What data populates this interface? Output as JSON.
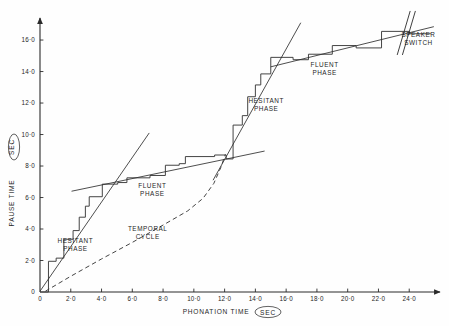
{
  "figure": {
    "background_color": "#fefefe",
    "ink_color": "#2a2a2a"
  },
  "chart_data": {
    "type": "line",
    "title": "",
    "subtitle": "",
    "xlabel_parts": {
      "main": "PHONATION  TIME",
      "unit": "SEC"
    },
    "ylabel_parts": {
      "main": "PAUSE  TIME",
      "unit": "SEC"
    },
    "xlabel": "PHONATION TIME (SEC)",
    "ylabel": "PAUSE TIME (SEC)",
    "xlim": [
      0,
      26
    ],
    "ylim": [
      0,
      17.4
    ],
    "grid": false,
    "legend_position": "none",
    "x_tick_values": [
      0,
      2,
      4,
      6,
      8,
      10,
      12,
      14,
      16,
      18,
      20,
      22,
      24
    ],
    "x_tick_labels": [
      "0",
      "2·0",
      "4·0",
      "6·0",
      "8·0",
      "10·0",
      "12·0",
      "14·0",
      "16·0",
      "18·0",
      "20·0",
      "22·0",
      "24·0"
    ],
    "y_tick_values": [
      0,
      2,
      4,
      6,
      8,
      10,
      12,
      14,
      16
    ],
    "y_tick_labels": [
      "0",
      "2·0",
      "4·0",
      "6·0",
      "8·0",
      "10·0",
      "12·0",
      "14·0",
      "16·0"
    ],
    "series": [
      {
        "name": "cumulative-staircase",
        "style": "step",
        "description": "Cumulative pause time plotted against cumulative phonation time as a staircase of alternating speech runs and pauses",
        "points": [
          [
            0.0,
            0.0
          ],
          [
            0.55,
            0.0
          ],
          [
            0.55,
            1.95
          ],
          [
            1.05,
            1.95
          ],
          [
            1.05,
            2.15
          ],
          [
            1.55,
            2.15
          ],
          [
            1.55,
            3.35
          ],
          [
            2.15,
            3.35
          ],
          [
            2.15,
            3.9
          ],
          [
            2.55,
            3.9
          ],
          [
            2.55,
            4.75
          ],
          [
            2.95,
            4.75
          ],
          [
            2.95,
            5.45
          ],
          [
            3.2,
            5.45
          ],
          [
            3.2,
            6.05
          ],
          [
            4.05,
            6.05
          ],
          [
            4.05,
            6.85
          ],
          [
            5.05,
            6.85
          ],
          [
            5.05,
            6.95
          ],
          [
            5.65,
            6.95
          ],
          [
            5.65,
            7.25
          ],
          [
            7.15,
            7.25
          ],
          [
            7.15,
            7.4
          ],
          [
            8.15,
            7.4
          ],
          [
            8.15,
            8.05
          ],
          [
            9.05,
            8.05
          ],
          [
            9.05,
            8.15
          ],
          [
            9.45,
            8.15
          ],
          [
            9.45,
            8.6
          ],
          [
            11.35,
            8.6
          ],
          [
            11.35,
            8.7
          ],
          [
            12.1,
            8.7
          ],
          [
            12.1,
            8.45
          ],
          [
            12.55,
            8.45
          ],
          [
            12.55,
            10.6
          ],
          [
            13.15,
            10.6
          ],
          [
            13.15,
            11.2
          ],
          [
            13.5,
            11.2
          ],
          [
            13.5,
            12.4
          ],
          [
            14.0,
            12.4
          ],
          [
            14.0,
            13.15
          ],
          [
            14.35,
            13.15
          ],
          [
            14.35,
            13.85
          ],
          [
            15.0,
            13.85
          ],
          [
            15.0,
            14.9
          ],
          [
            16.45,
            14.9
          ],
          [
            16.45,
            14.75
          ],
          [
            17.45,
            14.75
          ],
          [
            17.45,
            15.1
          ],
          [
            19.0,
            15.1
          ],
          [
            19.0,
            15.65
          ],
          [
            20.55,
            15.65
          ],
          [
            20.55,
            15.5
          ],
          [
            22.2,
            15.5
          ],
          [
            22.2,
            16.55
          ],
          [
            24.0,
            16.55
          ],
          [
            24.0,
            16.4
          ],
          [
            25.4,
            16.4
          ]
        ]
      },
      {
        "name": "hesitant-trend-1",
        "style": "line",
        "description": "Steep regression line through the first hesitant phase",
        "points": [
          [
            0.0,
            0.05
          ],
          [
            7.1,
            10.1
          ]
        ]
      },
      {
        "name": "fluent-trend-1",
        "style": "line",
        "description": "Shallow regression line through the first fluent phase",
        "points": [
          [
            2.05,
            6.4
          ],
          [
            14.6,
            8.95
          ]
        ]
      },
      {
        "name": "hesitant-trend-2",
        "style": "line",
        "description": "Steep regression line through the second hesitant phase",
        "points": [
          [
            11.25,
            7.1
          ],
          [
            16.95,
            17.1
          ]
        ]
      },
      {
        "name": "fluent-trend-2",
        "style": "line",
        "description": "Shallow regression line through the second fluent phase, extending past the speaker switch",
        "points": [
          [
            15.0,
            14.3
          ],
          [
            25.6,
            16.85
          ]
        ]
      },
      {
        "name": "temporal-cycle",
        "style": "dashed",
        "description": "Dashed smooth curve showing one full temporal cycle, shallow at first then rising steeply",
        "points": [
          [
            0.35,
            0.05
          ],
          [
            2.0,
            1.0
          ],
          [
            4.0,
            2.1
          ],
          [
            6.0,
            3.15
          ],
          [
            8.0,
            4.25
          ],
          [
            9.6,
            5.15
          ],
          [
            10.6,
            5.95
          ],
          [
            11.3,
            6.9
          ],
          [
            11.75,
            7.9
          ],
          [
            12.05,
            8.75
          ]
        ]
      }
    ],
    "annotations": [
      {
        "name": "hesitant-phase-1",
        "text_lines": [
          "HESITANT",
          "PHASE"
        ],
        "x": 2.3,
        "y": 3.1
      },
      {
        "name": "fluent-phase-1",
        "text_lines": [
          "FLUENT",
          "PHASE"
        ],
        "x": 7.3,
        "y": 6.6
      },
      {
        "name": "temporal-cycle",
        "text_lines": [
          "TEMPORAL",
          "CYCLE"
        ],
        "x": 7.0,
        "y": 3.9
      },
      {
        "name": "hesitant-phase-2",
        "text_lines": [
          "HESITANT",
          "PHASE"
        ],
        "x": 14.7,
        "y": 12.0
      },
      {
        "name": "fluent-phase-2",
        "text_lines": [
          "FLUENT",
          "PHASE"
        ],
        "x": 18.5,
        "y": 14.3
      },
      {
        "name": "speaker-switch",
        "text_lines": [
          "SPEAKER",
          "SWITCH"
        ],
        "x": 24.6,
        "y": 16.2
      }
    ],
    "break_marker": {
      "name": "speaker-switch-break",
      "description": "Double parallel slashes across the trend line marking a speaker switch",
      "x": 23.9
    }
  }
}
